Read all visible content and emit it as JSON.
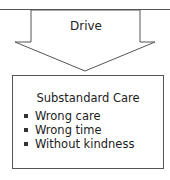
{
  "diagram": {
    "arrow": {
      "label": "Drive",
      "direction": "down"
    },
    "box": {
      "title": "Substandard Care",
      "items": [
        {
          "label": "Wrong care"
        },
        {
          "label": "Wrong time"
        },
        {
          "label": "Without kindness"
        }
      ]
    },
    "colors": {
      "stroke": "#555555",
      "text": "#222222",
      "background": "#ffffff"
    }
  }
}
